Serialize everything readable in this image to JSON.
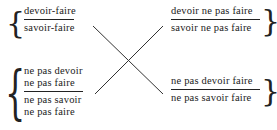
{
  "diagram": {
    "type": "semiotic-square",
    "top_left": {
      "numerator": "devoir-faire",
      "denominator": "savoir-faire",
      "brace": "{"
    },
    "top_right": {
      "numerator": "devoir ne pas faire",
      "denominator": "savoir ne pas faire",
      "brace": "}"
    },
    "bottom_left": {
      "numerator_line1": "ne pas devoir",
      "numerator_line2": "ne pas faire",
      "denominator_line1": "ne pas savoir",
      "denominator_line2": "ne pas faire",
      "brace": "{"
    },
    "bottom_right": {
      "numerator": "ne pas devoir faire",
      "denominator": "ne pas savoir faire",
      "brace": "}"
    },
    "connectors": [
      {
        "from": "top_left",
        "to": "bottom_right"
      },
      {
        "from": "top_right",
        "to": "bottom_left"
      }
    ],
    "colors": {
      "ink": "#1a1a1a",
      "background": "#ffffff"
    }
  }
}
